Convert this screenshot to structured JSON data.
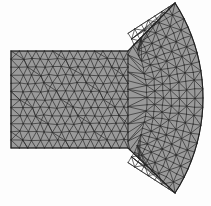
{
  "figure": {
    "title": "Triangular finite element mesh",
    "background_color": "#fdfdfd",
    "canvas": {
      "width": 211,
      "height": 206
    },
    "fill_color": "#9a9a9a",
    "edge_color": "#2b2b2b",
    "boundary_color": "#1f1f1f",
    "edge_width": 0.7,
    "boundary_width": 1.1
  },
  "chart_data": {
    "type": "mesh",
    "title": "Triangular finite element mesh",
    "xlabel": "",
    "ylabel": "",
    "grid": false,
    "legend": "none",
    "xlim": [
      0,
      211
    ],
    "ylim": [
      0,
      206
    ],
    "regions": [
      {
        "name": "rectangular-block",
        "shape": "rectangle",
        "x_min": 11,
        "x_max": 128,
        "y_min": 51,
        "y_max": 148,
        "nodes_x": 14,
        "nodes_y": 12,
        "element_type": "triangle",
        "fill": "#9a9a9a"
      },
      {
        "name": "curved-fan-wedge",
        "shape": "circular-sector-fan",
        "attach_x": 128,
        "attach_y_top": 51,
        "attach_y_bottom": 148,
        "apex_top_x": 175,
        "apex_top_y": 3,
        "apex_bottom_x": 175,
        "apex_bottom_y": 193,
        "arc_max_x": 203,
        "arc_mid_y": 98,
        "radial_divisions": 8,
        "angular_divisions": 22,
        "element_type": "triangle",
        "fill": "#9a9a9a"
      }
    ],
    "annotations": []
  }
}
